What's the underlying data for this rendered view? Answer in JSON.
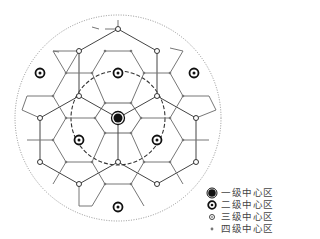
{
  "diagram": {
    "type": "central-place-hexagonal-network",
    "colors": {
      "line": "#444444",
      "node": "#333333",
      "circle": "#555555"
    },
    "outer_circle": {
      "cx": 118,
      "cy": 118,
      "r": 103,
      "style": "dotted"
    },
    "inner_circle": {
      "cx": 118,
      "cy": 118,
      "r": 47,
      "style": "dashed"
    }
  },
  "legend": {
    "items": [
      {
        "level": 1,
        "label": "一级中心区"
      },
      {
        "level": 2,
        "label": "二级中心区"
      },
      {
        "level": 3,
        "label": "三级中心区"
      },
      {
        "level": 4,
        "label": "四级中心区"
      }
    ]
  }
}
